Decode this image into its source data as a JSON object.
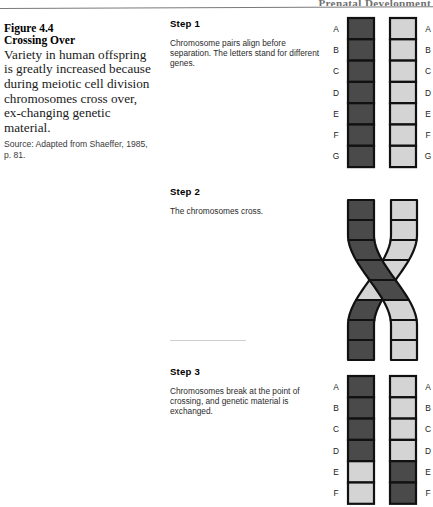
{
  "page": {
    "running_head": "Prenatal Development",
    "colors": {
      "chromatid_dark": "#4a4a4a",
      "chromatid_light": "#d4d4d4",
      "outline": "#111111",
      "rule": "#7a7a7a",
      "page_background": "#ffffff"
    }
  },
  "caption": {
    "figure_number": "Figure 4.4",
    "figure_title": "Crossing Over",
    "body": "Variety in human offspring is greatly increased because during meiotic cell division chromosomes cross over, ex-changing genetic material.",
    "source": "Source: Adapted from Shaeffer, 1985, p. 81."
  },
  "steps": [
    {
      "title": "Step 1",
      "text": "Chromosome pairs align before separation. The letters stand for different genes."
    },
    {
      "title": "Step 2",
      "text": "The chromosomes cross."
    },
    {
      "title": "Step 3",
      "text": "Chromosomes break at the point of crossing, and genetic material is exchanged."
    }
  ],
  "diagrams": {
    "step1": {
      "caption_ref": "Step 1",
      "left_labels": [
        "A",
        "B",
        "C",
        "D",
        "E",
        "F",
        "G"
      ],
      "right_labels": [
        "A",
        "B",
        "C",
        "D",
        "E",
        "F",
        "G"
      ],
      "left_segment_shades": [
        "dark",
        "dark",
        "dark",
        "dark",
        "dark",
        "dark",
        "dark"
      ],
      "right_segment_shades": [
        "light",
        "light",
        "light",
        "light",
        "light",
        "light",
        "light"
      ]
    },
    "step2": {
      "caption_ref": "Step 2",
      "left_labels": [],
      "right_labels": [],
      "left_segment_shades": [
        "dark",
        "dark",
        "dark",
        "dark",
        "dark",
        "light",
        "light",
        "light"
      ],
      "right_segment_shades": [
        "light",
        "light",
        "light",
        "light",
        "light",
        "dark",
        "dark",
        "dark"
      ],
      "note": "The two chromatids cross in an X shape at the chiasma."
    },
    "step3": {
      "caption_ref": "Step 3",
      "left_labels": [
        "A",
        "B",
        "C",
        "D",
        "E",
        "F"
      ],
      "right_labels": [
        "A",
        "B",
        "C",
        "D",
        "E",
        "F"
      ],
      "left_segment_shades": [
        "dark",
        "dark",
        "dark",
        "dark",
        "light",
        "light"
      ],
      "right_segment_shades": [
        "light",
        "light",
        "light",
        "light",
        "dark",
        "dark"
      ]
    }
  }
}
